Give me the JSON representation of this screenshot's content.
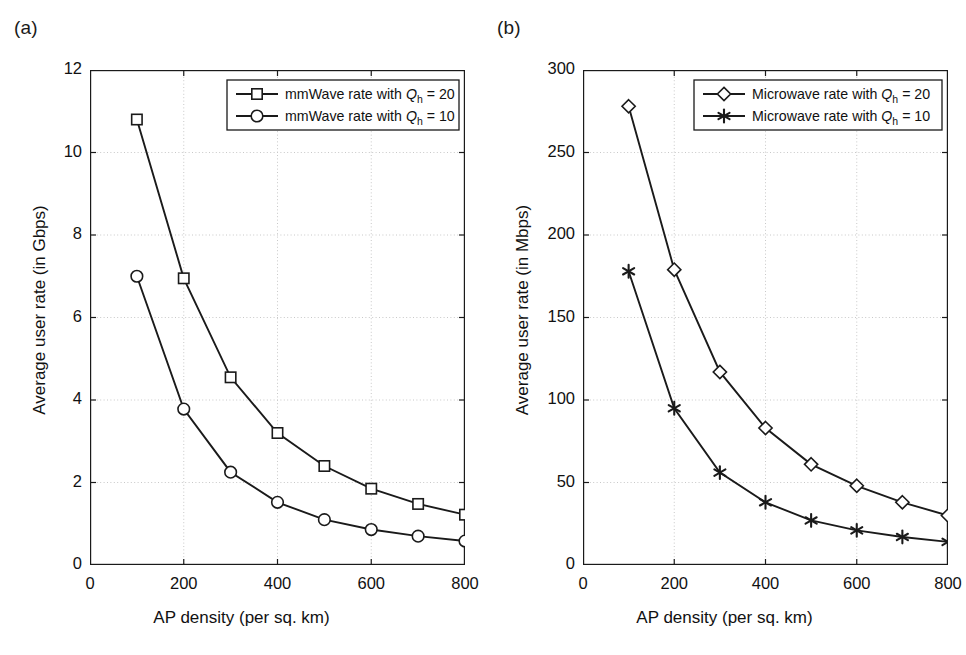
{
  "figure": {
    "background": "#ffffff",
    "line_color": "#1a1a1a",
    "grid_color": "#c8c8c8"
  },
  "panels": [
    {
      "label": "(a)",
      "panel_key": "a"
    },
    {
      "label": "(b)",
      "panel_key": "b"
    }
  ],
  "chart_data": [
    {
      "type": "line",
      "panel": "(a)",
      "title": "",
      "xlabel": "AP density (per sq. km)",
      "ylabel": "Average user rate (in Gbps)",
      "xlim": [
        0,
        800
      ],
      "ylim": [
        0,
        12
      ],
      "xticks": [
        0,
        200,
        400,
        600,
        800
      ],
      "yticks": [
        0,
        2,
        4,
        6,
        8,
        10,
        12
      ],
      "xtick_labels": [
        "0",
        "200",
        "400",
        "600",
        "800"
      ],
      "ytick_labels": [
        "0",
        "2",
        "4",
        "6",
        "8",
        "10",
        "12"
      ],
      "grid": true,
      "legend_position": "top-right",
      "x": [
        100,
        200,
        300,
        400,
        500,
        600,
        700,
        800
      ],
      "series": [
        {
          "name": "mmWave rate with Qh = 20",
          "legend_html": "mmWave rate with <tspan class='it'>Q</tspan><tspan class='sub'>h</tspan> = 20",
          "legend_prefix": "mmWave rate with ",
          "legend_symbol": "Q",
          "legend_sub": "h",
          "legend_suffix": " = 20",
          "marker": "square",
          "values": [
            10.8,
            6.95,
            4.55,
            3.2,
            2.4,
            1.85,
            1.48,
            1.22
          ]
        },
        {
          "name": "mmWave rate with Qh = 10",
          "legend_prefix": "mmWave rate with ",
          "legend_symbol": "Q",
          "legend_sub": "h",
          "legend_suffix": " = 10",
          "marker": "circle",
          "values": [
            7.0,
            3.78,
            2.25,
            1.52,
            1.1,
            0.86,
            0.7,
            0.58
          ]
        }
      ]
    },
    {
      "type": "line",
      "panel": "(b)",
      "title": "",
      "xlabel": "AP density (per sq. km)",
      "ylabel": "Average user rate (in Mbps)",
      "xlim": [
        0,
        800
      ],
      "ylim": [
        0,
        300
      ],
      "xticks": [
        0,
        200,
        400,
        600,
        800
      ],
      "yticks": [
        0,
        50,
        100,
        150,
        200,
        250,
        300
      ],
      "xtick_labels": [
        "0",
        "200",
        "400",
        "600",
        "800"
      ],
      "ytick_labels": [
        "0",
        "50",
        "100",
        "150",
        "200",
        "250",
        "300"
      ],
      "grid": true,
      "legend_position": "top-right",
      "x": [
        100,
        200,
        300,
        400,
        500,
        600,
        700,
        800
      ],
      "series": [
        {
          "name": "Microwave rate with Qh = 20",
          "legend_prefix": "Microwave rate with ",
          "legend_symbol": "Q",
          "legend_sub": "h",
          "legend_suffix": " = 20",
          "marker": "diamond",
          "values": [
            278,
            179,
            117,
            83,
            61,
            48,
            38,
            30
          ]
        },
        {
          "name": "Microwave rate with Qh = 10",
          "legend_prefix": "Microwave rate with ",
          "legend_symbol": "Q",
          "legend_sub": "h",
          "legend_suffix": " = 10",
          "marker": "star",
          "values": [
            178,
            95,
            56,
            38,
            27,
            21,
            17,
            14
          ]
        }
      ]
    }
  ]
}
